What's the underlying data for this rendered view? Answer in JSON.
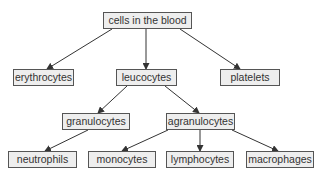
{
  "diagram": {
    "type": "tree",
    "colors": {
      "node_fill": "#eeeeee",
      "node_border": "#555555",
      "edge": "#333333",
      "text": "#333333"
    },
    "nodes": [
      {
        "id": "blood",
        "label": "cells in the blood",
        "x": 103,
        "y": 12,
        "w": 89,
        "h": 17
      },
      {
        "id": "ery",
        "label": "erythrocytes",
        "x": 13,
        "y": 69,
        "w": 61,
        "h": 17
      },
      {
        "id": "leu",
        "label": "leucocytes",
        "x": 116,
        "y": 69,
        "w": 61,
        "h": 17
      },
      {
        "id": "pla",
        "label": "platelets",
        "x": 220,
        "y": 69,
        "w": 60,
        "h": 17
      },
      {
        "id": "gra",
        "label": "granulocytes",
        "x": 62,
        "y": 113,
        "w": 68,
        "h": 17
      },
      {
        "id": "agr",
        "label": "agranulocytes",
        "x": 166,
        "y": 113,
        "w": 69,
        "h": 17
      },
      {
        "id": "neu",
        "label": "neutrophils",
        "x": 8,
        "y": 151,
        "w": 69,
        "h": 17
      },
      {
        "id": "mon",
        "label": "monocytes",
        "x": 88,
        "y": 151,
        "w": 68,
        "h": 17
      },
      {
        "id": "lym",
        "label": "lymphocytes",
        "x": 166,
        "y": 151,
        "w": 68,
        "h": 17
      },
      {
        "id": "mac",
        "label": "macrophages",
        "x": 246,
        "y": 151,
        "w": 68,
        "h": 17
      }
    ],
    "edges": [
      {
        "from": "blood",
        "to": "ery",
        "x1": 112,
        "y1": 29,
        "x2": 47,
        "y2": 69
      },
      {
        "from": "blood",
        "to": "leu",
        "x1": 146,
        "y1": 29,
        "x2": 146,
        "y2": 69
      },
      {
        "from": "blood",
        "to": "pla",
        "x1": 180,
        "y1": 29,
        "x2": 240,
        "y2": 69
      },
      {
        "from": "leu",
        "to": "gra",
        "x1": 127,
        "y1": 86,
        "x2": 98,
        "y2": 113
      },
      {
        "from": "leu",
        "to": "agr",
        "x1": 165,
        "y1": 86,
        "x2": 199,
        "y2": 113
      },
      {
        "from": "gra",
        "to": "neu",
        "x1": 88,
        "y1": 130,
        "x2": 45,
        "y2": 151
      },
      {
        "from": "agr",
        "to": "mon",
        "x1": 168,
        "y1": 130,
        "x2": 122,
        "y2": 151
      },
      {
        "from": "agr",
        "to": "lym",
        "x1": 200,
        "y1": 130,
        "x2": 200,
        "y2": 151
      },
      {
        "from": "agr",
        "to": "mac",
        "x1": 232,
        "y1": 130,
        "x2": 278,
        "y2": 151
      }
    ]
  }
}
